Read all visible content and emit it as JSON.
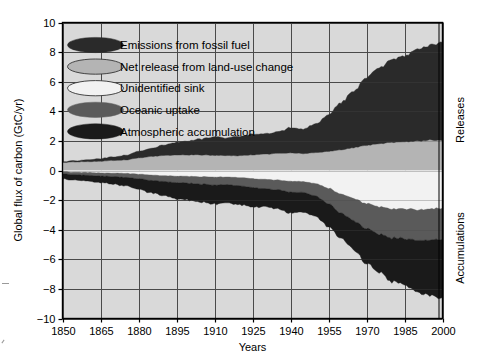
{
  "chart_data": {
    "type": "area",
    "title": "",
    "xlabel": "Years",
    "ylabel": "Global flux of carbon (GtC/yr)",
    "xlim": [
      1850,
      2000
    ],
    "ylim": [
      -10,
      10
    ],
    "xticks": [
      1850,
      1865,
      1880,
      1895,
      1910,
      1925,
      1940,
      1955,
      1970,
      1985,
      2000
    ],
    "yticks": [
      10,
      8,
      6,
      4,
      2,
      0,
      -2,
      -4,
      -6,
      -8,
      -10
    ],
    "grid": true,
    "legend_position": "upper-left-inside",
    "side_labels": {
      "upper": "Releases",
      "lower": "Accumulations"
    },
    "colors": {
      "emissions_fossil_fuel": "#2a2a2a",
      "net_release_land_use": "#b4b4b4",
      "unidentified_sink": "#f2f2f2",
      "oceanic_uptake": "#5a5a5a",
      "atmospheric_accumulation": "#1a1a1a",
      "plot_background": "#d9d9d9",
      "gridline": "#4a4a4a",
      "axis": "#000000"
    },
    "x": [
      1850,
      1855,
      1860,
      1865,
      1870,
      1875,
      1880,
      1885,
      1890,
      1895,
      1900,
      1905,
      1910,
      1915,
      1920,
      1925,
      1930,
      1935,
      1940,
      1945,
      1950,
      1955,
      1960,
      1965,
      1970,
      1975,
      1980,
      1985,
      1990,
      1995,
      2000
    ],
    "series": [
      {
        "name": "Net release from land-use change",
        "key": "net_release_land_use",
        "sign": "positive",
        "values": [
          0.55,
          0.58,
          0.6,
          0.63,
          0.68,
          0.72,
          0.85,
          0.95,
          1.0,
          1.05,
          1.05,
          1.05,
          1.02,
          1.0,
          1.0,
          1.05,
          1.1,
          1.15,
          1.18,
          1.15,
          1.2,
          1.3,
          1.4,
          1.55,
          1.7,
          1.8,
          1.9,
          1.95,
          2.0,
          2.05,
          2.05
        ]
      },
      {
        "name": "Emissions from fossil fuel",
        "key": "emissions_fossil_fuel",
        "sign": "positive",
        "values": [
          0.05,
          0.08,
          0.12,
          0.18,
          0.25,
          0.32,
          0.45,
          0.55,
          0.7,
          0.85,
          0.95,
          1.1,
          1.25,
          1.2,
          1.3,
          1.4,
          1.35,
          1.45,
          1.7,
          1.65,
          1.95,
          2.5,
          3.2,
          3.8,
          4.6,
          5.1,
          5.6,
          5.8,
          6.2,
          6.4,
          6.6
        ]
      },
      {
        "name": "Unidentified sink",
        "key": "unidentified_sink",
        "sign": "negative",
        "values": [
          0.1,
          0.12,
          0.14,
          0.16,
          0.18,
          0.2,
          0.25,
          0.3,
          0.35,
          0.38,
          0.4,
          0.42,
          0.45,
          0.45,
          0.48,
          0.55,
          0.6,
          0.65,
          0.72,
          0.75,
          0.9,
          1.2,
          1.6,
          1.9,
          2.25,
          2.45,
          2.6,
          2.6,
          2.65,
          2.6,
          2.55
        ]
      },
      {
        "name": "Oceanic uptake",
        "key": "oceanic_uptake",
        "sign": "negative",
        "values": [
          0.15,
          0.17,
          0.19,
          0.21,
          0.24,
          0.27,
          0.32,
          0.36,
          0.4,
          0.44,
          0.47,
          0.5,
          0.53,
          0.52,
          0.55,
          0.6,
          0.62,
          0.66,
          0.74,
          0.72,
          0.85,
          1.05,
          1.3,
          1.5,
          1.7,
          1.85,
          1.95,
          2.0,
          2.05,
          2.1,
          2.1
        ]
      },
      {
        "name": "Atmospheric accumulation",
        "key": "atmospheric_accumulation",
        "sign": "negative",
        "values": [
          0.35,
          0.37,
          0.39,
          0.44,
          0.51,
          0.57,
          0.73,
          0.84,
          0.95,
          1.08,
          1.13,
          1.23,
          1.29,
          1.23,
          1.27,
          1.3,
          1.23,
          1.29,
          1.42,
          1.33,
          1.4,
          1.55,
          1.7,
          1.95,
          2.35,
          2.6,
          2.95,
          3.15,
          3.5,
          3.75,
          4.0
        ]
      }
    ]
  },
  "legend": {
    "items": [
      {
        "label": "Emissions from fossil fuel",
        "marker": "ellipse-dark",
        "key": "emissions_fossil_fuel"
      },
      {
        "label": "Net release from land-use change",
        "marker": "ellipse-light-gray",
        "key": "net_release_land_use"
      },
      {
        "label": "Unidentified sink",
        "marker": "ellipse-white",
        "key": "unidentified_sink"
      },
      {
        "label": "Oceanic uptake",
        "marker": "ellipse-mid-gray",
        "key": "oceanic_uptake"
      },
      {
        "label": "Atmospheric accumulation",
        "marker": "ellipse-black",
        "key": "atmospheric_accumulation"
      }
    ]
  }
}
